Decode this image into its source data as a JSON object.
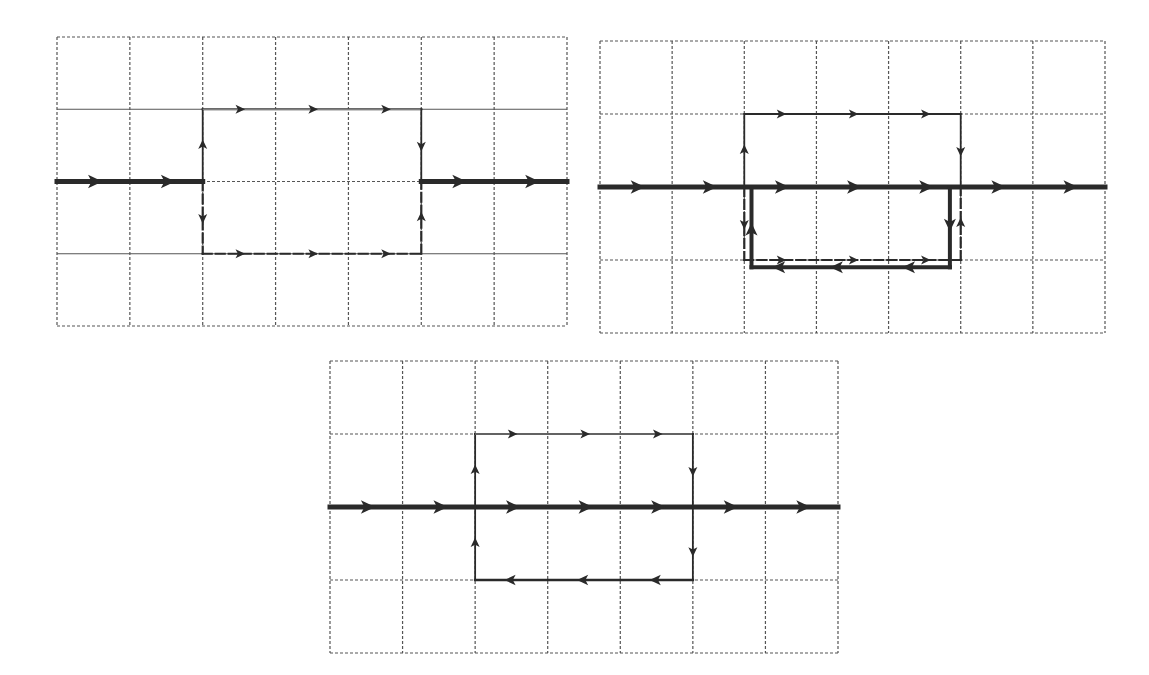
{
  "figure": {
    "colors": {
      "grid": "#555555",
      "line": "#2a2a2a",
      "background": "#ffffff"
    },
    "grid": {
      "cols": 7,
      "rows": 4
    },
    "panels": [
      {
        "id": "top-left",
        "box": {
          "x": 57,
          "y": 37,
          "w": 510,
          "h": 289
        },
        "solid_rows": [
          1,
          3
        ],
        "segments": [
          {
            "name": "main-path-left",
            "from": [
              0,
              2
            ],
            "to": [
              2,
              2
            ],
            "style": "thick",
            "arrows": [
              0.5,
              1.5
            ]
          },
          {
            "name": "main-path-right",
            "from": [
              5,
              2
            ],
            "to": [
              7,
              2
            ],
            "style": "thick",
            "arrows": [
              5.5,
              6.5
            ]
          },
          {
            "name": "upper-loop-left",
            "from": [
              2,
              2
            ],
            "to": [
              2,
              1
            ],
            "style": "thin",
            "arrows": [
              1.5
            ]
          },
          {
            "name": "upper-loop-top",
            "from": [
              2,
              1
            ],
            "to": [
              5,
              1
            ],
            "style": "double",
            "arrows": [
              2.5,
              3.5,
              4.5
            ]
          },
          {
            "name": "upper-loop-right",
            "from": [
              5,
              1
            ],
            "to": [
              5,
              2
            ],
            "style": "thin",
            "arrows": [
              1.5
            ]
          },
          {
            "name": "lower-loop-left",
            "from": [
              2,
              2
            ],
            "to": [
              2,
              3
            ],
            "style": "dash",
            "arrows": [
              2.5
            ]
          },
          {
            "name": "lower-loop-bottom",
            "from": [
              2,
              3
            ],
            "to": [
              5,
              3
            ],
            "style": "dash",
            "arrows": [
              2.5,
              3.5,
              4.5
            ]
          },
          {
            "name": "lower-loop-right",
            "from": [
              5,
              3
            ],
            "to": [
              5,
              2
            ],
            "style": "dash",
            "arrows": [
              2.5
            ]
          }
        ]
      },
      {
        "id": "top-right",
        "box": {
          "x": 600,
          "y": 41,
          "w": 505,
          "h": 292
        },
        "solid_rows": [],
        "segments": [
          {
            "name": "main-path",
            "from": [
              0,
              2
            ],
            "to": [
              7,
              2
            ],
            "style": "thick",
            "arrows": [
              0.5,
              1.5,
              2.5,
              3.5,
              4.5,
              5.5,
              6.5
            ]
          },
          {
            "name": "upper-loop-left",
            "from": [
              2,
              2
            ],
            "to": [
              2,
              1
            ],
            "style": "thin",
            "arrows": [
              1.5
            ]
          },
          {
            "name": "upper-loop-top",
            "from": [
              2,
              1
            ],
            "to": [
              5,
              1
            ],
            "style": "thin",
            "arrows": [
              2.5,
              3.5,
              4.5
            ]
          },
          {
            "name": "upper-loop-right",
            "from": [
              5,
              1
            ],
            "to": [
              5,
              2
            ],
            "style": "thin",
            "arrows": [
              1.5
            ]
          },
          {
            "name": "lower-dashed-left",
            "from": [
              2,
              2
            ],
            "to": [
              2,
              3
            ],
            "style": "dash",
            "arrows": [
              2.5
            ]
          },
          {
            "name": "lower-dashed-bottom",
            "from": [
              2,
              3
            ],
            "to": [
              5,
              3
            ],
            "style": "dash",
            "arrows": [
              2.5,
              3.5,
              4.5
            ]
          },
          {
            "name": "lower-dashed-right",
            "from": [
              5,
              3
            ],
            "to": [
              5,
              2
            ],
            "style": "dash",
            "arrows": [
              2.5
            ]
          },
          {
            "name": "reverse-loop-right",
            "from": [
              4.85,
              2
            ],
            "to": [
              4.85,
              3.1
            ],
            "style": "bold",
            "arrows": [
              2.5
            ]
          },
          {
            "name": "reverse-loop-bottom",
            "from": [
              4.85,
              3.1
            ],
            "to": [
              2.1,
              3.1
            ],
            "style": "bold",
            "arrows": [
              4.3,
              3.3,
              2.5
            ]
          },
          {
            "name": "reverse-loop-left",
            "from": [
              2.1,
              3.1
            ],
            "to": [
              2.1,
              2
            ],
            "style": "bold",
            "arrows": [
              2.6
            ]
          }
        ]
      },
      {
        "id": "bottom-center",
        "box": {
          "x": 330,
          "y": 361,
          "w": 508,
          "h": 292
        },
        "solid_rows": [],
        "segments": [
          {
            "name": "main-path",
            "from": [
              0,
              2
            ],
            "to": [
              7,
              2
            ],
            "style": "thick",
            "arrows": [
              0.5,
              1.5,
              2.5,
              3.5,
              4.5,
              5.5,
              6.5
            ]
          },
          {
            "name": "upper-loop-left",
            "from": [
              2,
              2
            ],
            "to": [
              2,
              1
            ],
            "style": "thin",
            "arrows": [
              1.5
            ]
          },
          {
            "name": "upper-loop-top",
            "from": [
              2,
              1
            ],
            "to": [
              5,
              1
            ],
            "style": "double",
            "arrows": [
              2.5,
              3.5,
              4.5
            ]
          },
          {
            "name": "upper-loop-right",
            "from": [
              5,
              1
            ],
            "to": [
              5,
              2
            ],
            "style": "thin",
            "arrows": [
              1.5
            ]
          },
          {
            "name": "lower-loop-right",
            "from": [
              5,
              2
            ],
            "to": [
              5,
              3
            ],
            "style": "thin",
            "arrows": [
              2.6
            ]
          },
          {
            "name": "lower-loop-bottom",
            "from": [
              5,
              3
            ],
            "to": [
              2,
              3
            ],
            "style": "medium",
            "arrows": [
              4.5,
              3.5,
              2.5
            ]
          },
          {
            "name": "lower-loop-left",
            "from": [
              2,
              3
            ],
            "to": [
              2,
              2
            ],
            "style": "thin",
            "arrows": [
              2.5
            ]
          }
        ]
      }
    ]
  }
}
